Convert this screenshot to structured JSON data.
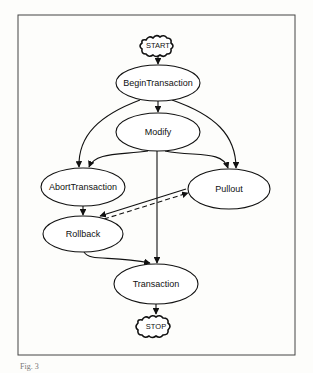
{
  "diagram": {
    "nodes": [
      {
        "id": "start",
        "label": "START",
        "shape": "cloud"
      },
      {
        "id": "begin",
        "label": "BeginTransaction",
        "shape": "ellipse"
      },
      {
        "id": "modify",
        "label": "Modify",
        "shape": "ellipse"
      },
      {
        "id": "abort",
        "label": "AbortTransaction",
        "shape": "ellipse"
      },
      {
        "id": "pullout",
        "label": "Pullout",
        "shape": "ellipse"
      },
      {
        "id": "rollback",
        "label": "Rollback",
        "shape": "ellipse"
      },
      {
        "id": "transaction",
        "label": "Transaction",
        "shape": "ellipse"
      },
      {
        "id": "stop",
        "label": "STOP",
        "shape": "cloud"
      }
    ],
    "edges": [
      {
        "from": "start",
        "to": "begin",
        "style": "solid"
      },
      {
        "from": "begin",
        "to": "modify",
        "style": "solid"
      },
      {
        "from": "begin",
        "to": "abort",
        "style": "solid"
      },
      {
        "from": "begin",
        "to": "pullout",
        "style": "solid"
      },
      {
        "from": "modify",
        "to": "abort",
        "style": "solid"
      },
      {
        "from": "modify",
        "to": "pullout",
        "style": "solid"
      },
      {
        "from": "modify",
        "to": "transaction",
        "style": "solid"
      },
      {
        "from": "abort",
        "to": "rollback",
        "style": "solid"
      },
      {
        "from": "pullout",
        "to": "rollback",
        "style": "solid"
      },
      {
        "from": "rollback",
        "to": "pullout",
        "style": "dashed"
      },
      {
        "from": "rollback",
        "to": "transaction",
        "style": "solid"
      },
      {
        "from": "transaction",
        "to": "stop",
        "style": "solid"
      }
    ]
  },
  "caption": "Fig. 3"
}
